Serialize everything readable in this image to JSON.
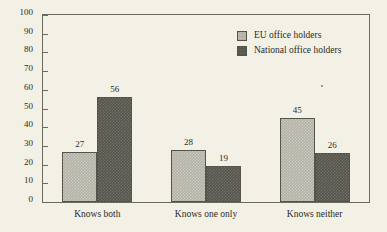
{
  "chart_data": {
    "type": "bar",
    "title": "",
    "xlabel": "",
    "ylabel": "",
    "ylim": [
      0,
      100
    ],
    "ytick_step": 10,
    "yticks": [
      0,
      10,
      20,
      30,
      40,
      50,
      60,
      70,
      80,
      90,
      100
    ],
    "ytick_labels": [
      "0",
      "10",
      "20",
      "30",
      "40",
      "50",
      "60",
      "70",
      "80",
      "90",
      "100"
    ],
    "grid": false,
    "legend_position": "top-right",
    "categories": [
      "Knows both",
      "Knows one only",
      "Knows neither"
    ],
    "series": [
      {
        "name": "EU office holders",
        "values": [
          27,
          28,
          45
        ],
        "value_labels": [
          "27",
          "28",
          "45"
        ],
        "color": "#b4b2a6"
      },
      {
        "name": "National office holders",
        "values": [
          56,
          19,
          26
        ],
        "value_labels": [
          "56",
          "19",
          "26"
        ],
        "color": "#57564d"
      }
    ],
    "annotations": []
  },
  "legend": {
    "items": [
      {
        "label": "EU office holders",
        "swatch": "light"
      },
      {
        "label": "National office holders",
        "swatch": "dark"
      }
    ]
  },
  "colors": {
    "background": "#f3f1e5",
    "axis": "#6b6a5e",
    "text": "#2b2a26",
    "series_light": "#b4b2a6",
    "series_dark": "#57564d"
  }
}
